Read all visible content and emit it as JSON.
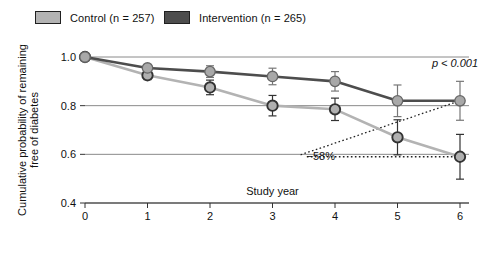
{
  "legend": {
    "entries": [
      {
        "label": "Control (n = 257)",
        "color": "#b3b3b3",
        "key": "control"
      },
      {
        "label": "Intervention (n = 265)",
        "color": "#4d4d4d",
        "key": "intervention"
      }
    ]
  },
  "annotations": {
    "pvalue": "p < 0.001",
    "reduction": "−58%"
  },
  "chart_data": {
    "type": "line",
    "title": "",
    "subtitle": "",
    "xlabel": "Study year",
    "ylabel": "Cumulative probability of remaining free of diabetes",
    "x": [
      0,
      1,
      2,
      3,
      4,
      5,
      6
    ],
    "xlim": [
      0,
      6
    ],
    "ylim": [
      0.4,
      1.0
    ],
    "xticks": [
      "0",
      "1",
      "2",
      "3",
      "4",
      "5",
      "6"
    ],
    "yticks": [
      "1.0",
      "0.8",
      "0.6",
      "0.4"
    ],
    "ytick_values": [
      1.0,
      0.8,
      0.6,
      0.4
    ],
    "grid": true,
    "legend_position": "top-left",
    "error_bars": "95% CI",
    "series": [
      {
        "name": "Control (n = 257)",
        "color": "#b3b3b3",
        "marker_fill": "#b0b0b0",
        "marker_edge": "#333333",
        "values": [
          1.0,
          0.925,
          0.875,
          0.8,
          0.785,
          0.67,
          0.59
        ],
        "err_low": [
          0.0,
          0.018,
          0.03,
          0.042,
          0.046,
          0.072,
          0.092
        ],
        "err_high": [
          0.0,
          0.018,
          0.03,
          0.042,
          0.046,
          0.072,
          0.092
        ]
      },
      {
        "name": "Intervention (n = 265)",
        "color": "#4d4d4d",
        "marker_fill": "#a8a8a8",
        "marker_edge": "#666666",
        "values": [
          1.0,
          0.955,
          0.94,
          0.92,
          0.9,
          0.82,
          0.82
        ],
        "err_low": [
          0.0,
          0.014,
          0.024,
          0.034,
          0.04,
          0.065,
          0.08
        ],
        "err_high": [
          0.0,
          0.014,
          0.024,
          0.034,
          0.04,
          0.065,
          0.08
        ]
      }
    ],
    "annotation_marks": [
      {
        "text": "p < 0.001",
        "x": 5.55,
        "y": 0.975
      },
      {
        "text": "−58%",
        "x": 4.0,
        "y": 0.592
      }
    ]
  }
}
